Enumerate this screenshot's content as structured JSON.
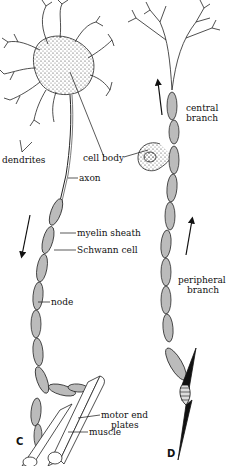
{
  "figure": {
    "panels": [
      {
        "id": "C",
        "label": "C",
        "description": "Motor neuron"
      },
      {
        "id": "D",
        "label": "D",
        "description": "Sensory neuron"
      }
    ],
    "labels": {
      "dendrites": "dendrites",
      "cell_body": "cell body",
      "axon": "axon",
      "myelin_sheath": "myelin sheath",
      "schwann_cell": "Schwann cell",
      "node": "node",
      "motor_end_plates_1": "motor end",
      "motor_end_plates_2": "plates",
      "muscle": "muscle",
      "central_branch_1": "central",
      "central_branch_2": "branch",
      "peripheral_branch_1": "peripheral",
      "peripheral_branch_2": "branch"
    },
    "arrows": [
      {
        "panel": "C",
        "direction": "down"
      },
      {
        "panel": "D",
        "branch": "central",
        "direction": "up"
      },
      {
        "panel": "D",
        "branch": "peripheral",
        "direction": "up"
      }
    ]
  }
}
